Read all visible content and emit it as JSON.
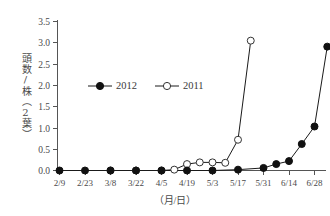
{
  "chart_data": {
    "type": "line",
    "title": "",
    "xlabel": "（月/日）",
    "ylabel": "頭数/株（2葉）",
    "ylim": [
      0.0,
      3.5
    ],
    "yticks": [
      "0.0",
      "0.5",
      "1.0",
      "1.5",
      "2.0",
      "2.5",
      "3.0",
      "3.5"
    ],
    "ytick_values": [
      0.0,
      0.5,
      1.0,
      1.5,
      2.0,
      2.5,
      3.0,
      3.5
    ],
    "grid": false,
    "legend_position": "upper-left-inside",
    "categories": [
      "2/9",
      "2/16",
      "2/23",
      "3/1",
      "3/8",
      "3/15",
      "3/22",
      "3/29",
      "4/5",
      "4/12",
      "4/19",
      "4/26",
      "5/3",
      "5/10",
      "5/17",
      "5/24",
      "5/31",
      "6/7",
      "6/14",
      "6/21",
      "6/28",
      "7/5"
    ],
    "xtick_labels": [
      "2/9",
      "2/23",
      "3/8",
      "3/22",
      "4/5",
      "4/19",
      "5/3",
      "5/17",
      "5/31",
      "6/14",
      "6/28"
    ],
    "series": [
      {
        "name": "2012",
        "marker": "filled-circle",
        "x": [
          "2/9",
          "2/23",
          "3/8",
          "3/22",
          "4/5",
          "4/19",
          "5/3",
          "5/17",
          "5/31",
          "6/7",
          "6/14",
          "6/21",
          "6/28",
          "7/5"
        ],
        "values": [
          0.0,
          0.0,
          0.0,
          0.0,
          0.0,
          0.0,
          0.0,
          0.02,
          0.06,
          0.15,
          0.22,
          0.62,
          1.03,
          2.9
        ]
      },
      {
        "name": "2011",
        "marker": "open-circle",
        "x": [
          "3/8",
          "3/22",
          "4/5",
          "4/12",
          "4/19",
          "4/26",
          "5/3",
          "5/10",
          "5/17",
          "5/24"
        ],
        "values": [
          0.0,
          0.0,
          0.0,
          0.02,
          0.15,
          0.19,
          0.19,
          0.18,
          0.72,
          3.04
        ]
      }
    ]
  },
  "legend": {
    "entries": [
      {
        "label": "2012",
        "marker": "filled-circle"
      },
      {
        "label": "2011",
        "marker": "open-circle"
      }
    ]
  },
  "axis": {
    "y_label": "頭数/株（2葉）",
    "x_caption": "（月/日）",
    "y_tick_0": "0.0",
    "y_tick_1": "0.5",
    "y_tick_2": "1.0",
    "y_tick_3": "1.5",
    "y_tick_4": "2.0",
    "y_tick_5": "2.5",
    "y_tick_6": "3.0",
    "y_tick_7": "3.5",
    "x_tick_0": "2/9",
    "x_tick_1": "2/23",
    "x_tick_2": "3/8",
    "x_tick_3": "3/22",
    "x_tick_4": "4/5",
    "x_tick_5": "4/19",
    "x_tick_6": "5/3",
    "x_tick_7": "5/17",
    "x_tick_8": "5/31",
    "x_tick_9": "6/14",
    "x_tick_10": "6/28"
  },
  "colors": {
    "axis": "#555555",
    "series_2012": "#111111",
    "series_2011": "#333333",
    "background": "#ffffff",
    "text": "#4a4a4a"
  }
}
